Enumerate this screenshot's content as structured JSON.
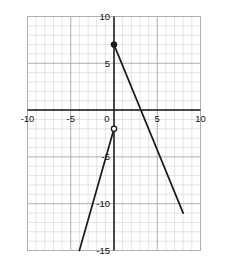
{
  "chart_data": {
    "type": "line",
    "title": "",
    "xlabel": "",
    "ylabel": "",
    "xlim": [
      -10,
      10
    ],
    "ylim": [
      -15,
      10
    ],
    "grid": true,
    "grid_minor_step": 1,
    "grid_major_step": 5,
    "legend": "none",
    "x_tick_labels": [
      "-10",
      "-5",
      "0",
      "5",
      "10"
    ],
    "x_tick_values": [
      -10,
      -5,
      0,
      5,
      10
    ],
    "y_tick_labels": [
      "10",
      "5",
      "0",
      "-5",
      "-10",
      "-15"
    ],
    "y_tick_values": [
      10,
      5,
      0,
      -5,
      -10,
      -15
    ],
    "series": [
      {
        "name": "descending-branch",
        "type": "line",
        "points": [
          [
            0,
            7
          ],
          [
            8,
            -11
          ]
        ],
        "slope": -2.25,
        "x_intercept": 3.1,
        "start_endpoint": "closed",
        "end_endpoint": "none"
      },
      {
        "name": "ascending-branch",
        "type": "line",
        "points": [
          [
            -4,
            -15
          ],
          [
            0,
            -2
          ]
        ],
        "slope": 3.25,
        "start_endpoint": "none",
        "end_endpoint": "open"
      }
    ],
    "markers": [
      {
        "name": "closed-point",
        "style": "filled-circle",
        "x": 0,
        "y": 7,
        "label": "(0, 7)"
      },
      {
        "name": "open-point",
        "style": "open-circle",
        "x": 0,
        "y": -2,
        "label": "(0, -2)"
      }
    ],
    "colors": {
      "curve": "#1a1a1a",
      "axis": "#1a1a1a",
      "major_grid": "#9a9aa2",
      "minor_grid": "#c9c9cf",
      "background": "#ffffff"
    }
  }
}
